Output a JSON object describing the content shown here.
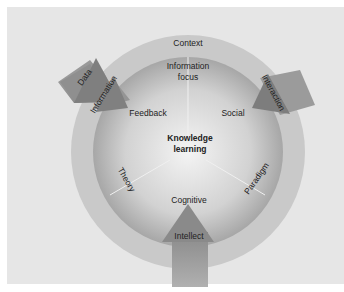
{
  "diagram": {
    "outer_ring_label": "Context",
    "center": {
      "line1": "Knowledge",
      "line2": "learning"
    },
    "segments": {
      "top": {
        "line1": "Information",
        "line2": "focus"
      },
      "left": "Feedback",
      "right": "Social",
      "bottom": "Cognitive"
    },
    "dividers": {
      "lower_left": "Theory",
      "lower_right": "Paradigm"
    },
    "arrows": {
      "data": "Data",
      "information": "Information",
      "interaction": "Interaction",
      "intellect": "Intellect"
    },
    "colors": {
      "background": "#e6e6e6",
      "outer_ring": "#c8c8c8",
      "sphere_light": "#f4f4f4",
      "sphere_dark": "#9a9a9a",
      "arrow": "#8c8c8c",
      "text": "#222222"
    }
  }
}
